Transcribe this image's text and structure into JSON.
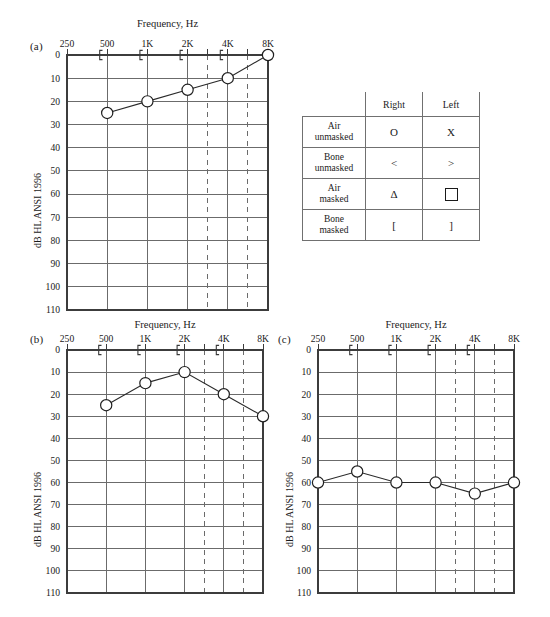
{
  "figure": {
    "y_axis_label": "dB HL ANSI 1996",
    "x_axis_label": "Frequency, Hz",
    "x_tick_labels": [
      "250",
      "500",
      "1K",
      "2K",
      "4K",
      "8K"
    ],
    "y_tick_labels": [
      "0",
      "10",
      "20",
      "30",
      "40",
      "50",
      "60",
      "70",
      "80",
      "90",
      "100",
      "110"
    ],
    "ylim": [
      0,
      110
    ],
    "dashed_gridline_labels": [
      "3K",
      "6K"
    ],
    "colors": {
      "gridline": "#6b6b6b",
      "frame": "#3c3c3c",
      "series": "#2a2a2a",
      "marker_fill": "#ffffff",
      "background": "#ffffff"
    }
  },
  "panels": [
    {
      "tag": "(a)",
      "title": "Frequency, Hz",
      "ylabel": "dB HL ANSI 1996",
      "chart_data": {
        "type": "line",
        "title": "Frequency, Hz",
        "xlabel": "Frequency, Hz",
        "ylabel": "dB HL ANSI 1996",
        "categories": [
          "250",
          "500",
          "1K",
          "2K",
          "4K",
          "8K"
        ],
        "ylim": [
          0,
          110
        ],
        "y_inverted": true,
        "grid": true,
        "legend": "none",
        "series": [
          {
            "name": "Air unmasked right",
            "marker": "O",
            "x": [
              "500",
              "1K",
              "2K",
              "4K",
              "8K"
            ],
            "values": [
              25,
              20,
              15,
              10,
              0
            ]
          },
          {
            "name": "Bone masked right",
            "marker": "[",
            "x": [
              "500",
              "1K",
              "2K",
              "4K"
            ],
            "values": [
              0,
              0,
              0,
              0
            ]
          }
        ]
      }
    },
    {
      "tag": "(b)",
      "title": "Frequency, Hz",
      "ylabel": "dB HL ANSI 1996",
      "chart_data": {
        "type": "line",
        "title": "Frequency, Hz",
        "xlabel": "Frequency, Hz",
        "ylabel": "dB HL ANSI 1996",
        "categories": [
          "250",
          "500",
          "1K",
          "2K",
          "4K",
          "8K"
        ],
        "ylim": [
          0,
          110
        ],
        "y_inverted": true,
        "grid": true,
        "legend": "none",
        "series": [
          {
            "name": "Air unmasked right",
            "marker": "O",
            "x": [
              "500",
              "1K",
              "2K",
              "4K",
              "8K"
            ],
            "values": [
              25,
              15,
              10,
              20,
              30
            ]
          },
          {
            "name": "Bone masked right",
            "marker": "[",
            "x": [
              "500",
              "1K",
              "2K",
              "4K"
            ],
            "values": [
              0,
              0,
              0,
              0
            ]
          }
        ]
      }
    },
    {
      "tag": "(c)",
      "title": "Frequency, Hz",
      "ylabel": "dB HL ANSI 1996",
      "chart_data": {
        "type": "line",
        "title": "Frequency, Hz",
        "xlabel": "Frequency, Hz",
        "ylabel": "dB HL ANSI 1996",
        "categories": [
          "250",
          "500",
          "1K",
          "2K",
          "4K",
          "8K"
        ],
        "ylim": [
          0,
          110
        ],
        "y_inverted": true,
        "grid": true,
        "legend": "none",
        "series": [
          {
            "name": "Air unmasked right",
            "marker": "O",
            "x": [
              "250",
              "500",
              "1K",
              "2K",
              "4K",
              "8K"
            ],
            "values": [
              60,
              55,
              60,
              60,
              65,
              60
            ]
          },
          {
            "name": "Bone masked right",
            "marker": "[",
            "x": [
              "500",
              "1K",
              "2K",
              "4K"
            ],
            "values": [
              0,
              0,
              0,
              0
            ]
          }
        ]
      }
    }
  ],
  "legend_table": {
    "column_headers": [
      "",
      "Right",
      "Left"
    ],
    "rows": [
      {
        "label": "Air\nunmasked",
        "label_line1": "Air",
        "label_line2": "unmasked",
        "right": "O",
        "left": "X",
        "right_kind": "glyph",
        "left_kind": "glyph"
      },
      {
        "label": "Bone\nunmasked",
        "label_line1": "Bone",
        "label_line2": "unmasked",
        "right": "<",
        "left": ">",
        "right_kind": "glyph",
        "left_kind": "glyph"
      },
      {
        "label": "Air\nmasked",
        "label_line1": "Air",
        "label_line2": "masked",
        "right": "Δ",
        "left": "",
        "right_kind": "glyph",
        "left_kind": "box"
      },
      {
        "label": "Bone\nmasked",
        "label_line1": "Bone",
        "label_line2": "masked",
        "right": "[",
        "left": "]",
        "right_kind": "glyph",
        "left_kind": "glyph"
      }
    ]
  }
}
